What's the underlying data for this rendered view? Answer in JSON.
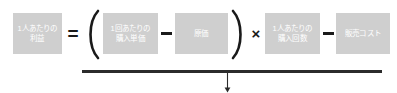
{
  "diagram": {
    "box_color": "#cfcfcf",
    "text_color": "#ffffff",
    "ink_color": "#1a1a1a",
    "rule_color": "#2b2b2b",
    "terms": [
      {
        "id": "profit-per-person",
        "line1": "1人あたりの",
        "line2": "利益"
      },
      {
        "id": "unit-price-per-purchase",
        "line1": "1回あたりの",
        "line2": "購入単価"
      },
      {
        "id": "cost-price",
        "line1": "原価",
        "line2": ""
      },
      {
        "id": "purchase-count-per-person",
        "line1": "1人あたりの",
        "line2": "購入回数"
      },
      {
        "id": "selling-cost",
        "line1": "販売コスト",
        "line2": ""
      }
    ],
    "operators": {
      "equals": "=",
      "open_paren": "(",
      "minus_inner": "−",
      "close_paren": ")",
      "times": "×",
      "minus_outer": "−"
    },
    "flow": {
      "arrow_direction": "down"
    }
  }
}
